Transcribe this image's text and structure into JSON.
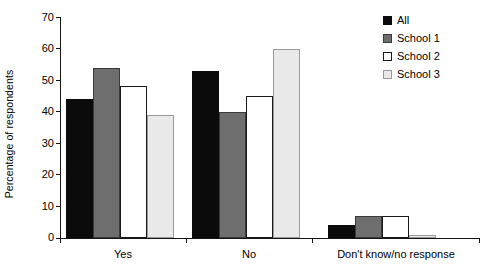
{
  "chart_data": {
    "type": "bar",
    "title": "",
    "subtitle": "",
    "xlabel": "",
    "ylabel": "Percentage of respondents",
    "categories": [
      "Yes",
      "No",
      "Don't know/no response"
    ],
    "series": [
      {
        "name": "All",
        "color": "#0b0b0b",
        "values": [
          44,
          53,
          4
        ]
      },
      {
        "name": "School 1",
        "color": "#6e6e6e",
        "values": [
          54,
          40,
          7
        ]
      },
      {
        "name": "School 2",
        "color": "#ffffff",
        "values": [
          48,
          45,
          7
        ]
      },
      {
        "name": "School 3",
        "color": "#e9e9e9",
        "values": [
          39,
          60,
          1
        ]
      }
    ],
    "ylim": [
      0,
      70
    ],
    "yticks": [
      0,
      10,
      20,
      30,
      40,
      50,
      60,
      70
    ],
    "ytick_labels": [
      "0",
      "10",
      "20",
      "30",
      "40",
      "50",
      "60",
      "70"
    ],
    "grid": false,
    "legend_position": "top-right"
  },
  "legend": {
    "entries": [
      {
        "label": "All"
      },
      {
        "label": "School 1"
      },
      {
        "label": "School 2"
      },
      {
        "label": "School 3"
      }
    ]
  },
  "axes": {
    "y_title": "Percentage of respondents",
    "y_tick_labels": [
      "70",
      "60",
      "50",
      "40",
      "30",
      "20",
      "10",
      "0"
    ],
    "x_tick_labels": [
      "Yes",
      "No",
      "Don't know/no response"
    ]
  }
}
